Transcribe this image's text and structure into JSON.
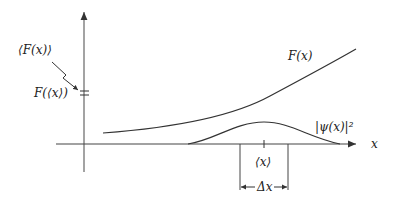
{
  "diagram": {
    "labels": {
      "expectation_F": "⟨F(x)⟩",
      "F_of_expectation": "F(⟨x⟩)",
      "F_curve": "F(x)",
      "psi_squared": "|ψ(x)|²",
      "x_axis": "x",
      "mean_x": "⟨x⟩",
      "delta_x": "Δx"
    },
    "colors": {
      "stroke": "#333333",
      "axis": "#555555"
    }
  }
}
